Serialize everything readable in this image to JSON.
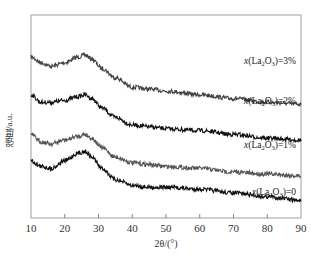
{
  "chart_data": {
    "type": "line",
    "title": "",
    "xlabel": "2θ/(°)",
    "ylabel": "强度/a.u.",
    "xlim": [
      10,
      90
    ],
    "xticks": [
      10,
      20,
      30,
      40,
      50,
      60,
      70,
      80,
      90
    ],
    "xtick_labels": [
      "10",
      "20",
      "30",
      "40",
      "50",
      "60",
      "70",
      "80",
      "90"
    ],
    "yticks": [],
    "grid": false,
    "legend": "inline labels at right of each curve",
    "offset_stacked": true,
    "x": [
      10,
      13,
      16,
      20,
      24,
      26,
      28,
      31,
      35,
      40,
      45,
      50,
      60,
      70,
      80,
      90
    ],
    "series": [
      {
        "name": "x(La2O3)=3%",
        "label_main": "x",
        "label_rest": "(La",
        "label_sub1": "2",
        "label_mid": "O",
        "label_sub2": "3",
        "label_end": ")=3%",
        "color": "#444444",
        "values": [
          0.8,
          0.77,
          0.75,
          0.77,
          0.8,
          0.81,
          0.79,
          0.74,
          0.69,
          0.64,
          0.63,
          0.62,
          0.6,
          0.58,
          0.56,
          0.55
        ]
      },
      {
        "name": "x(La2O3)=2%",
        "label_main": "x",
        "label_rest": "(La",
        "label_sub1": "2",
        "label_mid": "O",
        "label_sub2": "3",
        "label_end": ")=2%",
        "color": "#111111",
        "values": [
          0.6,
          0.56,
          0.56,
          0.57,
          0.59,
          0.6,
          0.58,
          0.53,
          0.48,
          0.44,
          0.43,
          0.42,
          0.41,
          0.39,
          0.37,
          0.36
        ]
      },
      {
        "name": "x(La2O3)=1%",
        "label_main": "x",
        "label_rest": "(La",
        "label_sub1": "2",
        "label_mid": "O",
        "label_sub2": "3",
        "label_end": ")=1%",
        "color": "#555555",
        "values": [
          0.39,
          0.35,
          0.34,
          0.36,
          0.38,
          0.39,
          0.37,
          0.32,
          0.27,
          0.24,
          0.23,
          0.22,
          0.21,
          0.19,
          0.18,
          0.17
        ]
      },
      {
        "name": "x(La2O3)=0",
        "label_main": "x",
        "label_rest": "(La",
        "label_sub1": "2",
        "label_mid": "O",
        "label_sub2": "3",
        "label_end": ")=0",
        "color": "#111111",
        "values": [
          0.25,
          0.22,
          0.21,
          0.25,
          0.29,
          0.3,
          0.27,
          0.21,
          0.15,
          0.12,
          0.11,
          0.11,
          0.1,
          0.08,
          0.06,
          0.04
        ]
      }
    ]
  },
  "labels": {
    "s3": "=3%",
    "s2": "=2%",
    "s1": "=1%",
    "s0": "=0",
    "xlabel": "2θ/(°)",
    "ylabel": "强度/a.u."
  }
}
